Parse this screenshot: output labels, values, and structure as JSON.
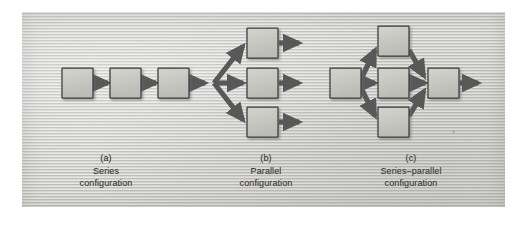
{
  "figure": {
    "background_color": "#cfcfcb",
    "box_fill": "#c9c9c4",
    "box_stroke": "#3a3a3a",
    "arrow_color": "#585858",
    "text_color": "#2d2d2d",
    "panel": {
      "x": 22,
      "y": 12,
      "width": 483,
      "height": 195
    }
  },
  "panels": [
    {
      "id": "a",
      "label": "(a)",
      "name_line": "Series",
      "caption_line": "configuration",
      "block_count": 3,
      "arrow_count": 3
    },
    {
      "id": "b",
      "label": "(b)",
      "name_line": "Parallel",
      "caption_line": "configuration",
      "block_count": 3,
      "arrow_count": 6
    },
    {
      "id": "c",
      "label": "(c)",
      "name_line": "Series–parallel",
      "caption_line": "configuration",
      "block_count": 5,
      "arrow_count": 8
    }
  ],
  "blocks": {
    "series": [
      {
        "x": 62,
        "y": 68
      },
      {
        "x": 110,
        "y": 68
      },
      {
        "x": 158,
        "y": 68
      }
    ],
    "parallel": [
      {
        "x": 247,
        "y": 28
      },
      {
        "x": 247,
        "y": 68
      },
      {
        "x": 247,
        "y": 107
      }
    ],
    "series_parallel": [
      {
        "x": 330,
        "y": 68
      },
      {
        "x": 378,
        "y": 26
      },
      {
        "x": 378,
        "y": 68
      },
      {
        "x": 378,
        "y": 107
      },
      {
        "x": 428,
        "y": 68
      }
    ],
    "size": {
      "width": 31,
      "height": 30
    }
  }
}
